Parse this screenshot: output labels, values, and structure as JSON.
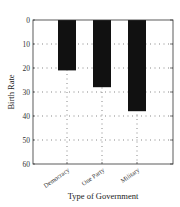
{
  "chart_data": {
    "type": "bar",
    "title": "",
    "xlabel": "Type of Government",
    "ylabel": "Birth Rate",
    "categories": [
      "Democracy",
      "One Party",
      "Military"
    ],
    "values": [
      21,
      28,
      38
    ],
    "ylim": [
      0,
      60
    ],
    "y_inverted": true,
    "yticks": [
      "0",
      "10",
      "20",
      "30",
      "40",
      "50",
      "60"
    ],
    "grid": "dotted",
    "legend": null,
    "bar_color": "#111111"
  }
}
